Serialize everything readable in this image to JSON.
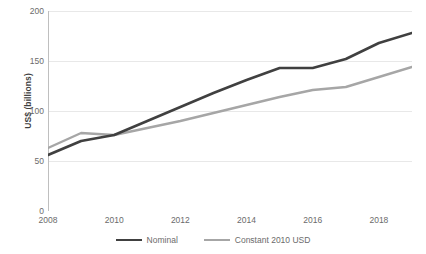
{
  "chart_data": {
    "type": "line",
    "title": "",
    "xlabel": "",
    "ylabel": "US$ (billions)",
    "x": [
      2008,
      2009,
      2010,
      2011,
      2012,
      2013,
      2014,
      2015,
      2016,
      2017,
      2018,
      2019
    ],
    "xlim": [
      2008,
      2019
    ],
    "ylim": [
      0,
      200
    ],
    "grid": true,
    "grid_axis": "y",
    "legend_position": "bottom",
    "x_tick_labels": [
      "2008",
      "2010",
      "2012",
      "2014",
      "2016",
      "2018"
    ],
    "x_tick_values": [
      2008,
      2010,
      2012,
      2014,
      2016,
      2018
    ],
    "y_tick_labels": [
      "0",
      "50",
      "100",
      "150",
      "200"
    ],
    "y_tick_values": [
      0,
      50,
      100,
      150,
      200
    ],
    "series": [
      {
        "name": "Nominal",
        "color": "#404040",
        "width": 2.6,
        "values": [
          56,
          70,
          76,
          90,
          104,
          118,
          131,
          143,
          143,
          152,
          168,
          178
        ]
      },
      {
        "name": "Constant 2010 USD",
        "color": "#a6a6a6",
        "width": 2.4,
        "values": [
          63,
          78,
          76,
          83,
          90,
          98,
          106,
          114,
          121,
          124,
          134,
          144
        ]
      }
    ]
  },
  "axis": {
    "y_title": "US$ (billions)"
  },
  "legend": {
    "items": [
      {
        "label": "Nominal"
      },
      {
        "label": "Constant 2010 USD"
      }
    ]
  },
  "colors": {
    "nominal": "#404040",
    "constant": "#a6a6a6",
    "gridline": "#e8e8e8",
    "axis": "#bfbfbf",
    "tick_text": "#6b6b6b",
    "title_text": "#3f3f3f",
    "background": "#ffffff"
  }
}
